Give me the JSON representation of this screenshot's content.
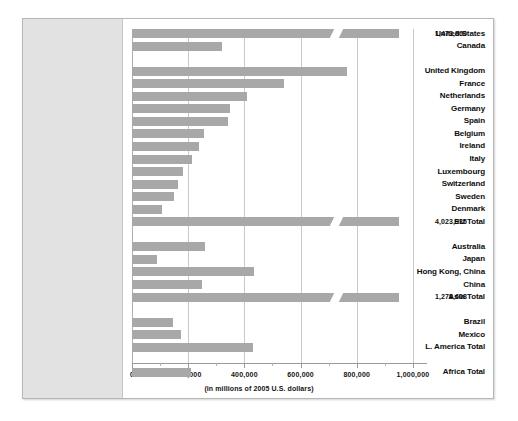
{
  "chart_data": {
    "type": "bar",
    "orientation": "horizontal",
    "title": "",
    "subtitle": "",
    "xlabel": "(in millions of 2005 U.S. dollars)",
    "ylabel": "",
    "xlim": [
      0,
      1050000
    ],
    "grid": true,
    "legend": null,
    "axis_break": true,
    "axis_break_note": "Bars for United States, EU Total and Asia Total are truncated with a diagonal break mark; their true values are printed at the right edge.",
    "xticks": [
      0,
      200000,
      400000,
      600000,
      800000,
      1000000
    ],
    "xtick_labels": [
      "0",
      "200,000",
      "400,000",
      "600,000",
      "800,000",
      "1,000,000"
    ],
    "categories": [
      "United States",
      "Canada",
      "United Kingdom",
      "France",
      "Netherlands",
      "Germany",
      "Spain",
      "Belgium",
      "Ireland",
      "Italy",
      "Luxembourg",
      "Switzerland",
      "Sweden",
      "Denmark",
      "EU Total",
      "Australia",
      "Japan",
      "Hong Kong, China",
      "China",
      "Asia Total",
      "Brazil",
      "Mexico",
      "L. America Total",
      "Africa Total"
    ],
    "values": [
      1473860,
      320000,
      765000,
      540000,
      410000,
      350000,
      340000,
      255000,
      240000,
      215000,
      180000,
      165000,
      150000,
      105000,
      4023935,
      260000,
      90000,
      435000,
      250000,
      1278608,
      145000,
      175000,
      430000,
      210000
    ],
    "rows": [
      {
        "label": "United States",
        "value": 1473860,
        "display_value": "1,473,860",
        "plotted_to": 950000,
        "broken": true,
        "group": "north-america",
        "show_value": true
      },
      {
        "label": "Canada",
        "value": 320000,
        "display_value": "",
        "plotted_to": 320000,
        "broken": false,
        "group": "north-america",
        "show_value": false
      },
      {
        "label": "United Kingdom",
        "value": 765000,
        "display_value": "",
        "plotted_to": 765000,
        "broken": false,
        "group": "europe",
        "show_value": false
      },
      {
        "label": "France",
        "value": 540000,
        "display_value": "",
        "plotted_to": 540000,
        "broken": false,
        "group": "europe",
        "show_value": false
      },
      {
        "label": "Netherlands",
        "value": 410000,
        "display_value": "",
        "plotted_to": 410000,
        "broken": false,
        "group": "europe",
        "show_value": false
      },
      {
        "label": "Germany",
        "value": 350000,
        "display_value": "",
        "plotted_to": 350000,
        "broken": false,
        "group": "europe",
        "show_value": false
      },
      {
        "label": "Spain",
        "value": 340000,
        "display_value": "",
        "plotted_to": 340000,
        "broken": false,
        "group": "europe",
        "show_value": false
      },
      {
        "label": "Belgium",
        "value": 255000,
        "display_value": "",
        "plotted_to": 255000,
        "broken": false,
        "group": "europe",
        "show_value": false
      },
      {
        "label": "Ireland",
        "value": 240000,
        "display_value": "",
        "plotted_to": 240000,
        "broken": false,
        "group": "europe",
        "show_value": false
      },
      {
        "label": "Italy",
        "value": 215000,
        "display_value": "",
        "plotted_to": 215000,
        "broken": false,
        "group": "europe",
        "show_value": false
      },
      {
        "label": "Luxembourg",
        "value": 180000,
        "display_value": "",
        "plotted_to": 180000,
        "broken": false,
        "group": "europe",
        "show_value": false
      },
      {
        "label": "Switzerland",
        "value": 165000,
        "display_value": "",
        "plotted_to": 165000,
        "broken": false,
        "group": "europe",
        "show_value": false
      },
      {
        "label": "Sweden",
        "value": 150000,
        "display_value": "",
        "plotted_to": 150000,
        "broken": false,
        "group": "europe",
        "show_value": false
      },
      {
        "label": "Denmark",
        "value": 105000,
        "display_value": "",
        "plotted_to": 105000,
        "broken": false,
        "group": "europe",
        "show_value": false
      },
      {
        "label": "EU Total",
        "value": 4023935,
        "display_value": "4,023,935",
        "plotted_to": 950000,
        "broken": true,
        "group": "europe",
        "show_value": true
      },
      {
        "label": "Australia",
        "value": 260000,
        "display_value": "",
        "plotted_to": 260000,
        "broken": false,
        "group": "asia",
        "show_value": false
      },
      {
        "label": "Japan",
        "value": 90000,
        "display_value": "",
        "plotted_to": 90000,
        "broken": false,
        "group": "asia",
        "show_value": false
      },
      {
        "label": "Hong Kong, China",
        "value": 435000,
        "display_value": "",
        "plotted_to": 435000,
        "broken": false,
        "group": "asia",
        "show_value": false
      },
      {
        "label": "China",
        "value": 250000,
        "display_value": "",
        "plotted_to": 250000,
        "broken": false,
        "group": "asia",
        "show_value": false
      },
      {
        "label": "Asia Total",
        "value": 1278608,
        "display_value": "1,278,608",
        "plotted_to": 950000,
        "broken": true,
        "group": "asia",
        "show_value": true
      },
      {
        "label": "Brazil",
        "value": 145000,
        "display_value": "",
        "plotted_to": 145000,
        "broken": false,
        "group": "latin-america",
        "show_value": false
      },
      {
        "label": "Mexico",
        "value": 175000,
        "display_value": "",
        "plotted_to": 175000,
        "broken": false,
        "group": "latin-america",
        "show_value": false
      },
      {
        "label": "L. America Total",
        "value": 430000,
        "display_value": "",
        "plotted_to": 430000,
        "broken": false,
        "group": "latin-america",
        "show_value": false
      },
      {
        "label": "Africa Total",
        "value": 210000,
        "display_value": "",
        "plotted_to": 210000,
        "broken": false,
        "group": "africa",
        "show_value": false
      }
    ],
    "colors": {
      "bar": "#a8a8a8",
      "label_panel": "#e2e2e2",
      "gridline": "#c9c9c9",
      "frame": "#b7b7b7",
      "text": "#0d0d0d",
      "background": "#ffffff"
    }
  }
}
